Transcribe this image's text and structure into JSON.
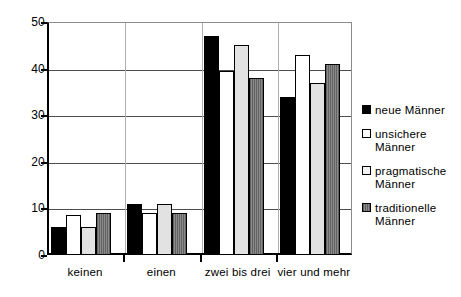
{
  "chart_data": {
    "type": "bar",
    "title": "",
    "subtitle": "",
    "xlabel": "",
    "ylabel": "",
    "categories": [
      "keinen",
      "einen",
      "zwei bis drei",
      "vier und mehr"
    ],
    "series": [
      {
        "name": "neue Männer",
        "values": [
          6,
          11,
          47,
          34
        ],
        "color": "#000000",
        "fill": "solid-black"
      },
      {
        "name": "unsichere Männer",
        "values": [
          8.5,
          9,
          39.5,
          43
        ],
        "color": "#ffffff",
        "fill": "white-outline"
      },
      {
        "name": "pragmatische Männer",
        "values": [
          6,
          11,
          45,
          37
        ],
        "color": "#e2e2e2",
        "fill": "light-gray"
      },
      {
        "name": "traditionelle Männer",
        "values": [
          9,
          9,
          38,
          41
        ],
        "color": "#7d7d7d",
        "fill": "hatched-gray"
      }
    ],
    "ylim": [
      0,
      50
    ],
    "yticks": [
      0,
      10,
      20,
      30,
      40,
      50
    ],
    "ytick_labels": [
      "0",
      "10",
      "20",
      "30",
      "40",
      "50"
    ],
    "grid": {
      "horizontal": true,
      "vertical": true
    },
    "legend": {
      "position": "right",
      "entries": [
        "neue Männer",
        "unsichere Männer",
        "pragmatische Männer",
        "traditionelle Männer"
      ]
    }
  },
  "legend": {
    "entries": [
      {
        "label": "neue Männer"
      },
      {
        "label": "unsichere Männer"
      },
      {
        "label": "pragmatische Männer"
      },
      {
        "label": "traditionelle Männer"
      }
    ]
  }
}
